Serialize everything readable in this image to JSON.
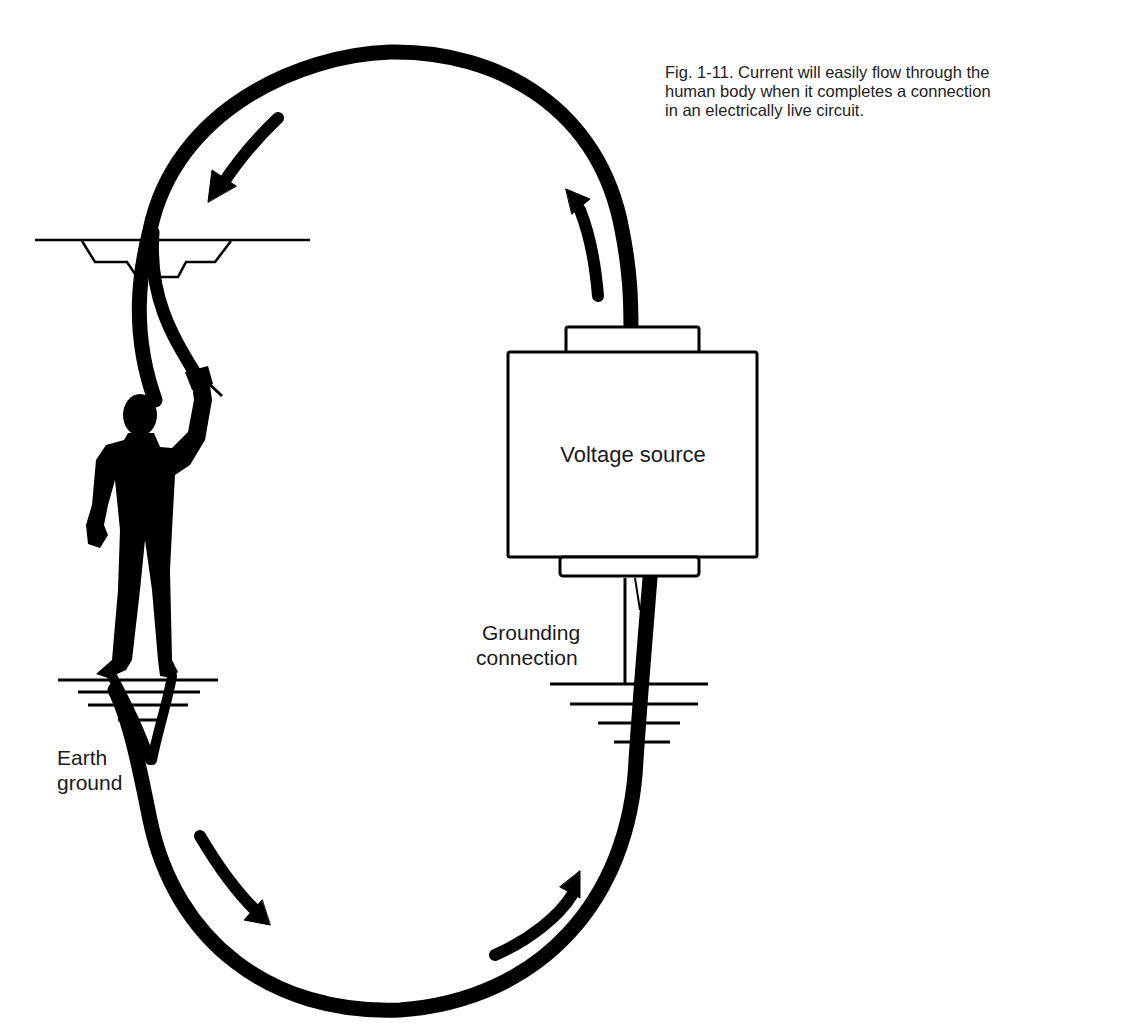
{
  "caption": {
    "lines": [
      "Fig. 1-11. Current will easily flow through the",
      "human body when it completes a connection",
      "in an electrically live circuit."
    ]
  },
  "labels": {
    "voltage_source": "Voltage source",
    "grounding_connection": [
      "Grounding",
      "connection"
    ],
    "earth_ground": [
      "Earth",
      "ground"
    ]
  },
  "diagram": {
    "stroke_color": "#000000",
    "background": "#ffffff",
    "elements": [
      "circuit-loop-wire",
      "current-arrows",
      "ceiling-fixture",
      "human-silhouette",
      "voltage-source-box",
      "grounding-wire",
      "earth-ground-symbols"
    ],
    "current_direction": "counterclockwise through person from source top, down through body to earth, back to source"
  }
}
